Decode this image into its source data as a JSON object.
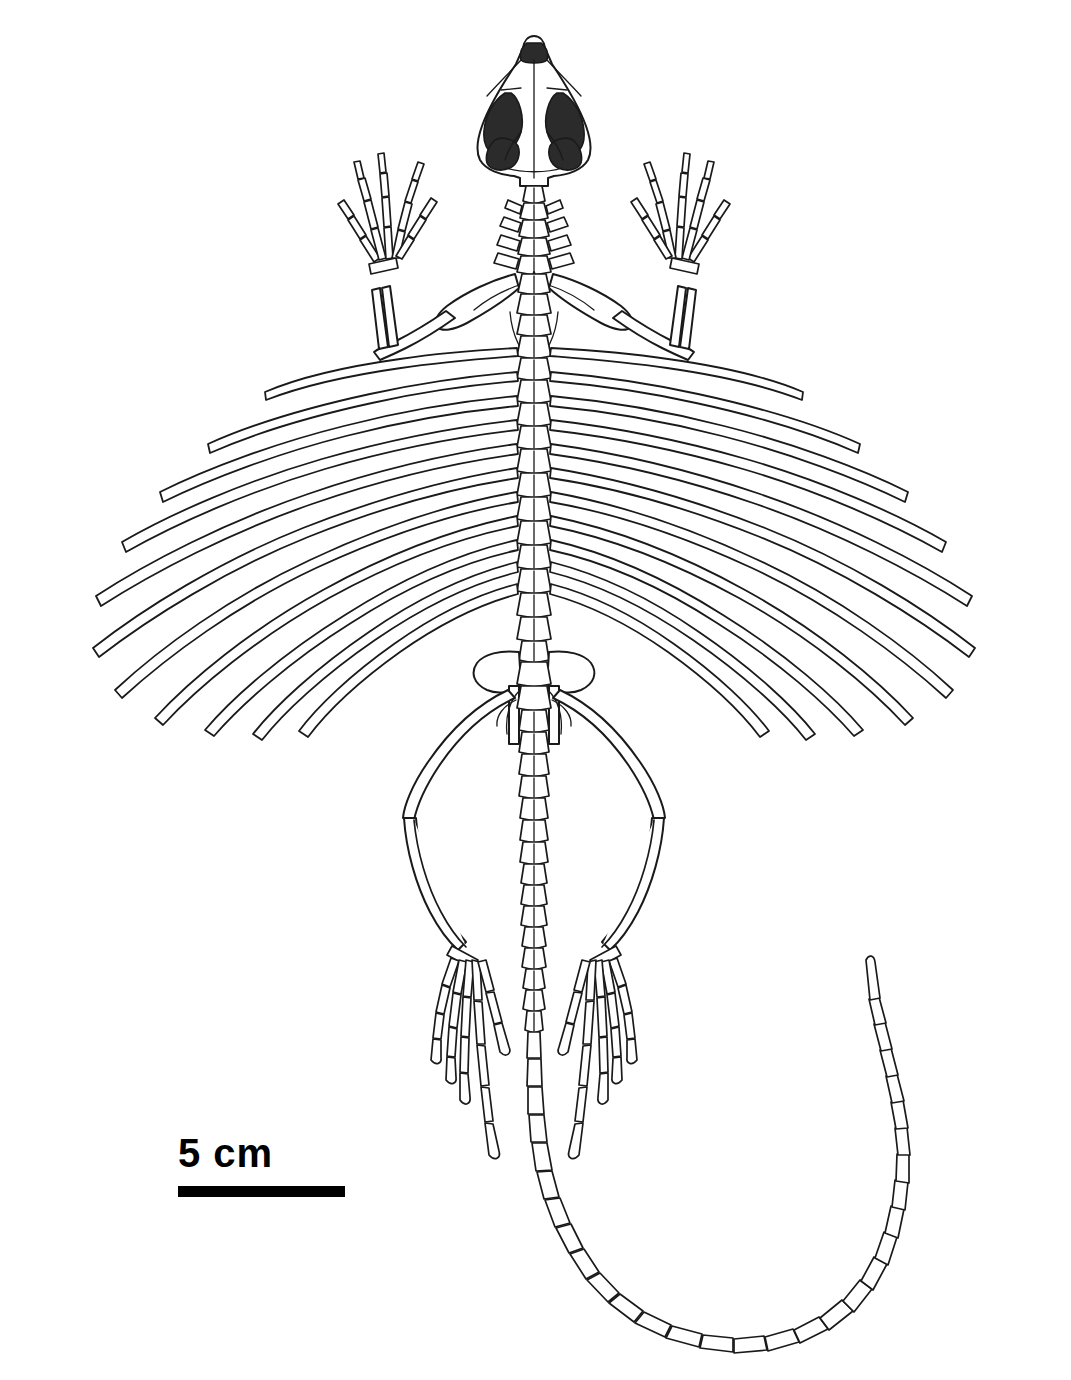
{
  "figure": {
    "kind": "scientific-illustration",
    "view": "dorsal",
    "background_color": "#ffffff",
    "line_color": "#1a1a1a",
    "fill_color": "#ffffff",
    "shaded_color": "#2b2b2b"
  },
  "scale_bar": {
    "label": "5 cm",
    "value": 5,
    "unit": "cm",
    "bar_length_px": 167,
    "bar_thickness_px": 11,
    "bar_color": "#000000",
    "label_color": "#000000",
    "position": "lower-left"
  },
  "anatomy": {
    "skull": {
      "name": "skull",
      "outline": "triangular, dorsal aspect",
      "shaded_openings": [
        "left orbit",
        "right orbit",
        "left supratemporal fenestra",
        "right supratemporal fenestra",
        "naris"
      ],
      "opening_fill": "#2b2b2b"
    },
    "regions": [
      {
        "name": "skull",
        "count": 1
      },
      {
        "name": "cervical vertebrae",
        "count": 8
      },
      {
        "name": "dorsal vertebrae",
        "count": 17
      },
      {
        "name": "sacral vertebrae",
        "count": 2
      },
      {
        "name": "caudal vertebrae",
        "count": 42
      },
      {
        "name": "elongated patagial ribs (left)",
        "count": 11
      },
      {
        "name": "elongated patagial ribs (right)",
        "count": 11
      },
      {
        "name": "forelimbs",
        "count": 2
      },
      {
        "name": "hindlimbs",
        "count": 2
      }
    ],
    "limb_elements": {
      "forelimb": [
        "humerus",
        "radius",
        "ulna",
        "carpals",
        "metacarpals",
        "phalanges"
      ],
      "hindlimb": [
        "femur",
        "tibia",
        "fibula",
        "tarsals",
        "metatarsals",
        "phalanges"
      ],
      "manus_digits": 5,
      "pes_digits": 5
    },
    "girdles": [
      "pectoral girdle",
      "pelvic girdle"
    ],
    "tail": {
      "description": "long, curving in a broad U to the lower right",
      "segments": 42
    }
  }
}
